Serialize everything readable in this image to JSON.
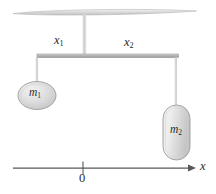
{
  "figure": {
    "background_color": "#ffffff",
    "ink_color": "#2b2b2b"
  },
  "labels": {
    "x1": {
      "base": "x",
      "sub": "1"
    },
    "x2": {
      "base": "x",
      "sub": "2"
    },
    "m1": {
      "base": "m",
      "sub": "1"
    },
    "m2": {
      "base": "m",
      "sub": "2"
    },
    "origin": "0",
    "axis": "x"
  },
  "elements": {
    "ceiling": {
      "name": "ceiling-bar",
      "fill": "#dcdcdc",
      "stroke": "#b4b4b4"
    },
    "support_rod": {
      "name": "vertical-support-rod",
      "fill": "#c8c8c8"
    },
    "beam": {
      "name": "horizontal-beam",
      "fill": "#b0b0b0",
      "stroke": "#8c8c8c"
    },
    "string_left": {
      "name": "left-string",
      "stroke": "#bdbdbd"
    },
    "string_right": {
      "name": "right-string",
      "stroke": "#bdbdbd"
    },
    "mass1": {
      "name": "mass-m1",
      "shape": "ellipse",
      "fill": "#d9d9d9",
      "stroke": "#9a9a9a"
    },
    "mass2": {
      "name": "mass-m2",
      "shape": "capsule",
      "fill": "#d9d9d9",
      "stroke": "#9a9a9a"
    },
    "axis": {
      "name": "x-axis",
      "stroke": "#555555"
    },
    "tick": {
      "name": "origin-tick",
      "stroke": "#555555"
    }
  },
  "geometry": {
    "ceiling": {
      "x_left": 12,
      "x_right": 197,
      "y": 12
    },
    "support_rod": {
      "x": 84,
      "y_top": 15,
      "y_bottom": 55
    },
    "beam": {
      "x_left": 37,
      "x_right": 178,
      "y": 55
    },
    "string_left": {
      "x": 37,
      "y_top": 57,
      "y_bottom": 82
    },
    "string_right": {
      "x": 176,
      "y_top": 57,
      "y_bottom": 107
    },
    "mass1": {
      "cx": 37,
      "cy": 95,
      "rx": 19,
      "ry": 14
    },
    "mass2": {
      "x": 163,
      "y": 105,
      "w": 27,
      "h": 55,
      "r": 13.5
    },
    "axis": {
      "x_start": 13,
      "x_end": 195,
      "y": 168
    },
    "tick": {
      "x": 83,
      "y_top": 162,
      "y_bottom": 174
    }
  }
}
